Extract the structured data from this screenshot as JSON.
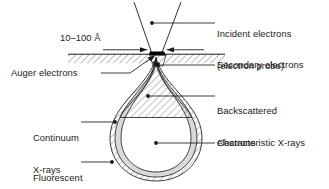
{
  "diagram": {
    "type": "scientific-schematic",
    "colors": {
      "stroke": "#1a1a1a",
      "text": "#1a1a1a",
      "background": "#ffffff",
      "probe_spot": "#000000",
      "continuum_band": "#d9d9d9",
      "hatch": "#555555"
    },
    "labels": {
      "incident_line1": "Incident electrons",
      "incident_line2": "(electron probe)",
      "dimension": "10–100 Å",
      "auger": "Auger electrons",
      "secondary": "Secondary electrons",
      "backscattered_line1": "Backscattered",
      "backscattered_line2": "electrons",
      "continuum_line1": "Continuum",
      "continuum_line2": "X-rays",
      "fluorescent_line1": "Fluorescent",
      "fluorescent_line2": "X-rays",
      "characteristic": "Characteristic X-rays"
    }
  }
}
